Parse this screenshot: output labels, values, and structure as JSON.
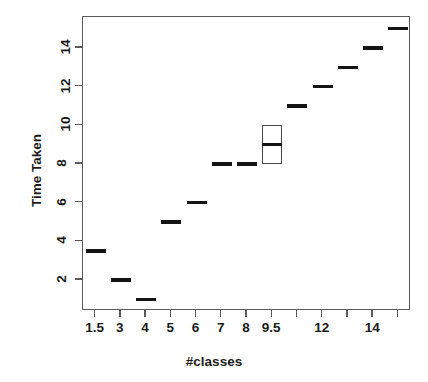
{
  "chart_data": {
    "type": "box",
    "title": "",
    "xlabel": "#classes",
    "ylabel": "Time Taken",
    "grid": false,
    "legend": null,
    "xlim": [
      0.5,
      13.5
    ],
    "ylim": [
      0.4,
      15.6
    ],
    "y_ticks": [
      2,
      4,
      6,
      8,
      10,
      12,
      14
    ],
    "y_tick_labels": [
      "2",
      "4",
      "6",
      "8",
      "10",
      "12",
      "14"
    ],
    "x_tick_positions": [
      1,
      2,
      3,
      4,
      5,
      6,
      7,
      8,
      9,
      10,
      11,
      12,
      13
    ],
    "x_tick_labels": [
      "1.5",
      "3",
      "4",
      "5",
      "6",
      "7",
      "8",
      "9.5",
      "",
      "12",
      "",
      "14",
      ""
    ],
    "categories": [
      "1.5",
      "3",
      "4",
      "5",
      "6",
      "7",
      "8",
      "9.5",
      "",
      "12",
      "",
      "14",
      ""
    ],
    "boxes": [
      {
        "category": "1.5",
        "x": 1,
        "median": 3.5,
        "q1": 3.5,
        "q3": 3.5,
        "degenerate": true
      },
      {
        "category": "3",
        "x": 2,
        "median": 2,
        "q1": 2,
        "q3": 2,
        "degenerate": true
      },
      {
        "category": "4",
        "x": 3,
        "median": 1,
        "q1": 1,
        "q3": 1,
        "degenerate": true
      },
      {
        "category": "5",
        "x": 4,
        "median": 5,
        "q1": 5,
        "q3": 5,
        "degenerate": true
      },
      {
        "category": "6",
        "x": 5,
        "median": 6,
        "q1": 6,
        "q3": 6,
        "degenerate": true
      },
      {
        "category": "7",
        "x": 6,
        "median": 8,
        "q1": 8,
        "q3": 8,
        "degenerate": true
      },
      {
        "category": "8",
        "x": 7,
        "median": 8,
        "q1": 8,
        "q3": 8,
        "degenerate": true
      },
      {
        "category": "9.5",
        "x": 8,
        "median": 9,
        "q1": 8,
        "q3": 10,
        "degenerate": false
      },
      {
        "category": "",
        "x": 9,
        "median": 11,
        "q1": 11,
        "q3": 11,
        "degenerate": true
      },
      {
        "category": "12",
        "x": 10,
        "median": 12,
        "q1": 12,
        "q3": 12,
        "degenerate": true
      },
      {
        "category": "",
        "x": 11,
        "median": 13,
        "q1": 13,
        "q3": 13,
        "degenerate": true
      },
      {
        "category": "14",
        "x": 12,
        "median": 14,
        "q1": 14,
        "q3": 14,
        "degenerate": true
      },
      {
        "category": "",
        "x": 13,
        "median": 15,
        "q1": 15,
        "q3": 15,
        "degenerate": true
      }
    ],
    "colors": {
      "mark": "#141414",
      "box_border": "#4a4a4a",
      "axis": "#5a5a5a",
      "text": "#1a1a1a",
      "background": "#ffffff"
    }
  }
}
